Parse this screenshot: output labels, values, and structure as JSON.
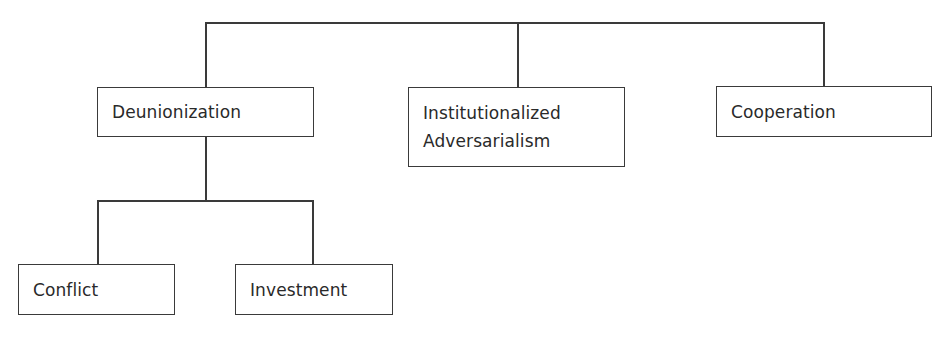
{
  "diagram": {
    "type": "tree",
    "root": {
      "label": "",
      "children": [
        "Deunionization",
        "Institutionalized Adversarialism",
        "Cooperation"
      ]
    },
    "nodes": {
      "deunionization": {
        "label": "Deunionization",
        "children": [
          "Conflict",
          "Investment"
        ]
      },
      "institutionalized_adversarialism": {
        "label": "Institutionalized\nAdversarialism"
      },
      "cooperation": {
        "label": "Cooperation"
      },
      "conflict": {
        "label": "Conflict"
      },
      "investment": {
        "label": "Investment"
      }
    },
    "edges": [
      {
        "from": "root",
        "to": "deunionization"
      },
      {
        "from": "root",
        "to": "institutionalized_adversarialism"
      },
      {
        "from": "root",
        "to": "cooperation"
      },
      {
        "from": "deunionization",
        "to": "conflict"
      },
      {
        "from": "deunionization",
        "to": "investment"
      }
    ],
    "colors": {
      "line": "#3a3a3a",
      "text": "#2a2a2a",
      "background": "#ffffff"
    }
  }
}
